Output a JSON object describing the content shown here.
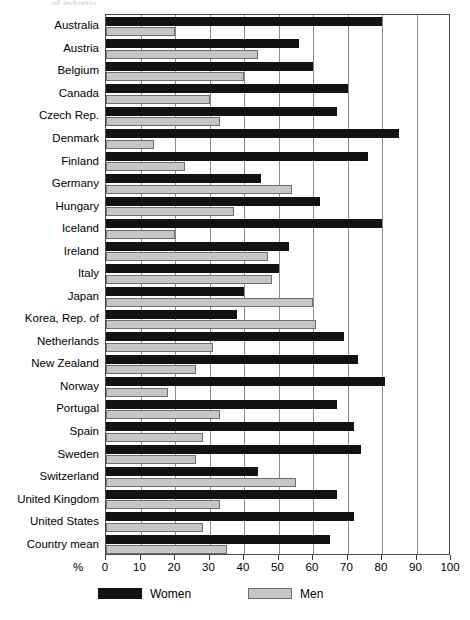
{
  "title_sliver": "of industry",
  "axis": {
    "percent_symbol": "%",
    "x_ticks": [
      0,
      10,
      20,
      30,
      40,
      50,
      60,
      70,
      80,
      90,
      100
    ],
    "xlim": [
      0,
      100
    ]
  },
  "legend": {
    "items": [
      {
        "label": "Women",
        "color": "#121212",
        "name": "women"
      },
      {
        "label": "Men",
        "color": "#c6c6c6",
        "name": "men"
      }
    ]
  },
  "chart_data": {
    "type": "bar",
    "orientation": "horizontal",
    "title": "",
    "xlabel": "%",
    "ylabel": "",
    "xlim": [
      0,
      100
    ],
    "xticks": [
      0,
      10,
      20,
      30,
      40,
      50,
      60,
      70,
      80,
      90,
      100
    ],
    "grid": true,
    "legend_position": "bottom-left",
    "categories": [
      "Australia",
      "Austria",
      "Belgium",
      "Canada",
      "Czech Rep.",
      "Denmark",
      "Finland",
      "Germany",
      "Hungary",
      "Iceland",
      "Ireland",
      "Italy",
      "Japan",
      "Korea, Rep. of",
      "Netherlands",
      "New Zealand",
      "Norway",
      "Portugal",
      "Spain",
      "Sweden",
      "Switzerland",
      "United Kingdom",
      "United States",
      "Country mean"
    ],
    "series": [
      {
        "name": "Women",
        "color": "#121212",
        "values": [
          80,
          56,
          60,
          70,
          67,
          85,
          76,
          45,
          62,
          80,
          53,
          50,
          40,
          38,
          69,
          73,
          81,
          67,
          72,
          74,
          44,
          67,
          72,
          65
        ]
      },
      {
        "name": "Men",
        "color": "#c6c6c6",
        "values": [
          20,
          44,
          40,
          30,
          33,
          14,
          23,
          54,
          37,
          20,
          47,
          48,
          60,
          61,
          31,
          26,
          18,
          33,
          28,
          26,
          55,
          33,
          28,
          35
        ]
      }
    ]
  }
}
